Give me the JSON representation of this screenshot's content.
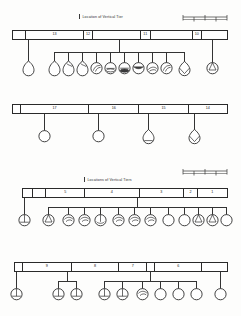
{
  "figure": {
    "background": "#fdfdfc",
    "ink": "#2a2a2a"
  },
  "labels": {
    "top": "Location of Vertical Tier",
    "middle": "Locations of Vertical Tiers"
  },
  "scalebars": [
    {
      "name": "scale-bar-top"
    },
    {
      "name": "scale-bar-middle"
    }
  ],
  "rows": [
    {
      "id": "row-1",
      "cells": [
        {
          "label": "",
          "width": 14
        },
        {
          "label": "13",
          "width": 60
        },
        {
          "label": "12",
          "width": 10
        },
        {
          "label": "",
          "width": 50
        },
        {
          "label": "11",
          "width": 10
        },
        {
          "label": "",
          "width": 44
        },
        {
          "label": "10",
          "width": 10
        },
        {
          "label": "",
          "width": 26
        }
      ],
      "vessels": [
        {
          "x": 28,
          "type": "plain-jar"
        },
        {
          "x": 54,
          "type": "plain-jar"
        },
        {
          "x": 68,
          "type": "jar-rim"
        },
        {
          "x": 82,
          "type": "jar-rim"
        },
        {
          "x": 96,
          "type": "bowl-handle"
        },
        {
          "x": 110,
          "type": "lid-flat"
        },
        {
          "x": 124,
          "type": "lid-dark"
        },
        {
          "x": 138,
          "type": "bowl-dark"
        },
        {
          "x": 152,
          "type": "bowl-spout"
        },
        {
          "x": 166,
          "type": "bowl-handle"
        },
        {
          "x": 184,
          "type": "cup-v"
        },
        {
          "x": 212,
          "type": "bowl-notch"
        }
      ]
    },
    {
      "id": "row-2",
      "cells": [
        {
          "label": "",
          "width": 8
        },
        {
          "label": "17",
          "width": 72
        },
        {
          "label": "16",
          "width": 52
        },
        {
          "label": "15",
          "width": 52
        },
        {
          "label": "14",
          "width": 40
        }
      ],
      "vessels": [
        {
          "x": 44,
          "type": "circle"
        },
        {
          "x": 98,
          "type": "circle"
        },
        {
          "x": 148,
          "type": "jar-round"
        },
        {
          "x": 194,
          "type": "cup-v"
        }
      ]
    },
    {
      "id": "row-3",
      "cells": [
        {
          "label": "",
          "width": 10
        },
        {
          "label": "",
          "width": 14
        },
        {
          "label": "5",
          "width": 40
        },
        {
          "label": "4",
          "width": 56
        },
        {
          "label": "3",
          "width": 46
        },
        {
          "label": "2",
          "width": 14
        },
        {
          "label": "1",
          "width": 30
        }
      ],
      "vessels": [
        {
          "x": 24,
          "type": "bowl-cross"
        },
        {
          "x": 48,
          "type": "bowl-notch"
        },
        {
          "x": 68,
          "type": "bowl-swirl"
        },
        {
          "x": 84,
          "type": "bowl-swirl"
        },
        {
          "x": 100,
          "type": "bowl-line"
        },
        {
          "x": 118,
          "type": "bowl-swirl"
        },
        {
          "x": 134,
          "type": "bowl-swirl"
        },
        {
          "x": 150,
          "type": "bowl-swirl"
        },
        {
          "x": 168,
          "type": "circle"
        },
        {
          "x": 184,
          "type": "circle"
        },
        {
          "x": 198,
          "type": "bowl-notch"
        },
        {
          "x": 212,
          "type": "bowl-notch"
        },
        {
          "x": 226,
          "type": "circle"
        }
      ]
    },
    {
      "id": "row-4",
      "cells": [
        {
          "label": "",
          "width": 8
        },
        {
          "label": "9",
          "width": 52
        },
        {
          "label": "8",
          "width": 50
        },
        {
          "label": "7",
          "width": 30
        },
        {
          "label": "",
          "width": 8
        },
        {
          "label": "6",
          "width": 50
        },
        {
          "label": "",
          "width": 26
        }
      ],
      "vessels": [
        {
          "x": 16,
          "type": "bowl-cross"
        },
        {
          "x": 58,
          "type": "bowl-cross"
        },
        {
          "x": 76,
          "type": "bowl-cross"
        },
        {
          "x": 104,
          "type": "bowl-cross"
        },
        {
          "x": 122,
          "type": "bowl-cross"
        },
        {
          "x": 142,
          "type": "bowl-swirl"
        },
        {
          "x": 160,
          "type": "circle"
        },
        {
          "x": 178,
          "type": "circle"
        },
        {
          "x": 196,
          "type": "circle"
        },
        {
          "x": 220,
          "type": "circle"
        }
      ]
    }
  ]
}
